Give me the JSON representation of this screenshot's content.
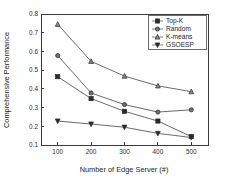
{
  "chart_data": {
    "type": "line",
    "title": "",
    "xlabel": "Number of  Edge Server (#)",
    "ylabel": "Comprehensive Performance",
    "categories": [
      100,
      200,
      300,
      400,
      500
    ],
    "x": [
      100,
      200,
      300,
      400,
      500
    ],
    "xtick_labels": [
      "100",
      "200",
      "300",
      "400",
      "500"
    ],
    "ytick_labels": [
      "0.1",
      "0.2",
      "0.3",
      "0.4",
      "0.5",
      "0.6",
      "0.7",
      "0.8"
    ],
    "ytick_values": [
      0.1,
      0.2,
      0.3,
      0.4,
      0.5,
      0.6,
      0.7,
      0.8
    ],
    "xlim": [
      50,
      550
    ],
    "ylim": [
      0.1,
      0.8
    ],
    "grid": false,
    "legend_position": "top-right",
    "series": [
      {
        "name": "Top-K",
        "marker": "square",
        "values": [
          0.465,
          0.348,
          0.28,
          0.228,
          0.145
        ]
      },
      {
        "name": "Random",
        "marker": "circle",
        "values": [
          0.578,
          0.378,
          0.316,
          0.276,
          0.288
        ]
      },
      {
        "name": "K-means",
        "marker": "triangle-up",
        "values": [
          0.745,
          0.547,
          0.468,
          0.416,
          0.385
        ]
      },
      {
        "name": "GSOESP",
        "marker": "triangle-down",
        "values": [
          0.228,
          0.212,
          0.195,
          0.162,
          0.14
        ]
      }
    ]
  },
  "legend": {
    "entries": [
      {
        "label": "Top-K"
      },
      {
        "label": "Random"
      },
      {
        "label": "K-means"
      },
      {
        "label": "GSOESP"
      }
    ]
  },
  "colors": {
    "axis": "#3a3a3a",
    "line": "#4f4f4f",
    "marker_dark": "#2a2a2a",
    "background": "#ffffff"
  }
}
